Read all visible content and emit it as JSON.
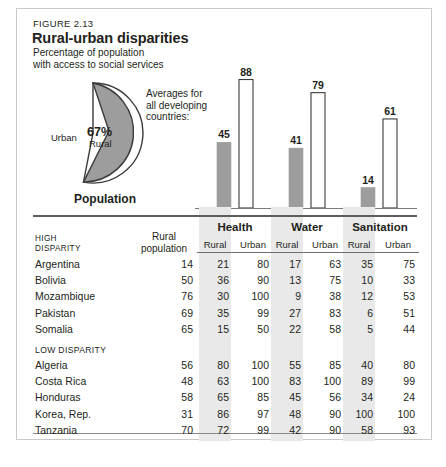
{
  "figure": {
    "number": "FIGURE 2.13",
    "title": "Rural-urban disparities",
    "subtitle_line1": "Percentage of population",
    "subtitle_line2": "with access to social services"
  },
  "pie": {
    "rural_percent_label": "67%",
    "rural_label": "Rural",
    "urban_label": "Urban",
    "caption": "Population",
    "rural_value": 67,
    "urban_value": 33,
    "rural_color": "#9d9d9d",
    "urban_color": "#ffffff"
  },
  "averages_note": {
    "line1": "Averages for",
    "line2": "all developing",
    "line3": "countries:"
  },
  "chart_data": {
    "type": "bar",
    "title": "Percentage of population with access to social services",
    "categories": [
      "Health",
      "Water",
      "Sanitation"
    ],
    "series": [
      {
        "name": "Rural",
        "values": [
          45,
          41,
          14
        ],
        "color": "#9d9d9d"
      },
      {
        "name": "Urban",
        "values": [
          88,
          79,
          61
        ],
        "color": "#ffffff"
      }
    ],
    "ylim": [
      0,
      100
    ],
    "ylabel": "",
    "xlabel": "",
    "grid": false,
    "legend": "none",
    "data_labels": [
      45,
      88,
      41,
      79,
      14,
      61
    ]
  },
  "table": {
    "left_header_line1": "HIGH",
    "left_header_line2": "DISPARITY",
    "rural_population_line1": "Rural",
    "rural_population_line2": "population",
    "groups": [
      "Health",
      "Water",
      "Sanitation"
    ],
    "subheaders": [
      "Rural",
      "Urban"
    ],
    "low_disparity_label": "LOW DISPARITY",
    "high_rows": [
      {
        "country": "Argentina",
        "rural_pop": "14",
        "health_rural": "21",
        "health_urban": "80",
        "water_rural": "17",
        "water_urban": "63",
        "san_rural": "35",
        "san_urban": "75"
      },
      {
        "country": "Bolivia",
        "rural_pop": "50",
        "health_rural": "36",
        "health_urban": "90",
        "water_rural": "13",
        "water_urban": "75",
        "san_rural": "10",
        "san_urban": "33"
      },
      {
        "country": "Mozambique",
        "rural_pop": "76",
        "health_rural": "30",
        "health_urban": "100",
        "water_rural": "9",
        "water_urban": "38",
        "san_rural": "12",
        "san_urban": "53"
      },
      {
        "country": "Pakistan",
        "rural_pop": "69",
        "health_rural": "35",
        "health_urban": "99",
        "water_rural": "27",
        "water_urban": "83",
        "san_rural": "6",
        "san_urban": "51"
      },
      {
        "country": "Somalia",
        "rural_pop": "65",
        "health_rural": "15",
        "health_urban": "50",
        "water_rural": "22",
        "water_urban": "58",
        "san_rural": "5",
        "san_urban": "44"
      }
    ],
    "low_rows": [
      {
        "country": "Algeria",
        "rural_pop": "56",
        "health_rural": "80",
        "health_urban": "100",
        "water_rural": "55",
        "water_urban": "85",
        "san_rural": "40",
        "san_urban": "80"
      },
      {
        "country": "Costa Rica",
        "rural_pop": "48",
        "health_rural": "63",
        "health_urban": "100",
        "water_rural": "83",
        "water_urban": "100",
        "san_rural": "89",
        "san_urban": "99"
      },
      {
        "country": "Honduras",
        "rural_pop": "58",
        "health_rural": "65",
        "health_urban": "85",
        "water_rural": "45",
        "water_urban": "56",
        "san_rural": "34",
        "san_urban": "24"
      },
      {
        "country": "Korea, Rep.",
        "rural_pop": "31",
        "health_rural": "86",
        "health_urban": "97",
        "water_rural": "48",
        "water_urban": "90",
        "san_rural": "100",
        "san_urban": "100"
      },
      {
        "country": "Tanzania",
        "rural_pop": "70",
        "health_rural": "72",
        "health_urban": "99",
        "water_rural": "42",
        "water_urban": "90",
        "san_rural": "58",
        "san_urban": "93"
      }
    ]
  }
}
